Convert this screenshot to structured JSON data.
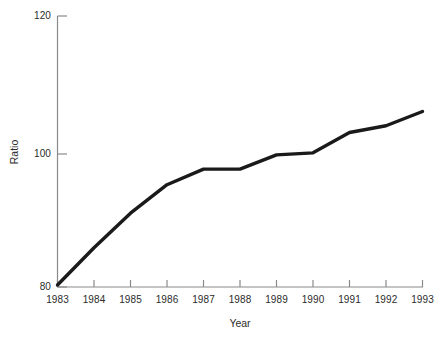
{
  "chart_data": {
    "type": "line",
    "title": "",
    "xlabel": "Year",
    "ylabel": "Ratio",
    "categories": [
      "1983",
      "1984",
      "1985",
      "1986",
      "1987",
      "1988",
      "1989",
      "1990",
      "1991",
      "1992",
      "1993"
    ],
    "x": [
      1983,
      1984,
      1985,
      1986,
      1987,
      1988,
      1989,
      1990,
      1991,
      1992,
      1993
    ],
    "values": [
      80.3,
      85.8,
      90.9,
      95.1,
      97.4,
      97.4,
      99.5,
      99.8,
      102.8,
      103.8,
      105.9
    ],
    "series": [
      {
        "name": "Ratio",
        "values": [
          80.3,
          85.8,
          90.9,
          95.1,
          97.4,
          97.4,
          99.5,
          99.8,
          102.8,
          103.8,
          105.9
        ]
      }
    ],
    "ylim": [
      80,
      120
    ],
    "xlim": [
      1983,
      1993
    ],
    "yticks": [
      80,
      100,
      120
    ],
    "ytick_labels": [
      "80",
      "100",
      "120"
    ],
    "xtick_labels": [
      "1983",
      "1984",
      "1985",
      "1986",
      "1987",
      "1988",
      "1989",
      "1990",
      "1991",
      "1992",
      "1993"
    ],
    "grid": false,
    "legend": false,
    "legend_position": "none",
    "line_color": "#1a1a1a",
    "axis_color": "#8a8a8a",
    "background_color": "#ffffff"
  },
  "axes": {
    "y_title": "Ratio",
    "x_title": "Year"
  }
}
